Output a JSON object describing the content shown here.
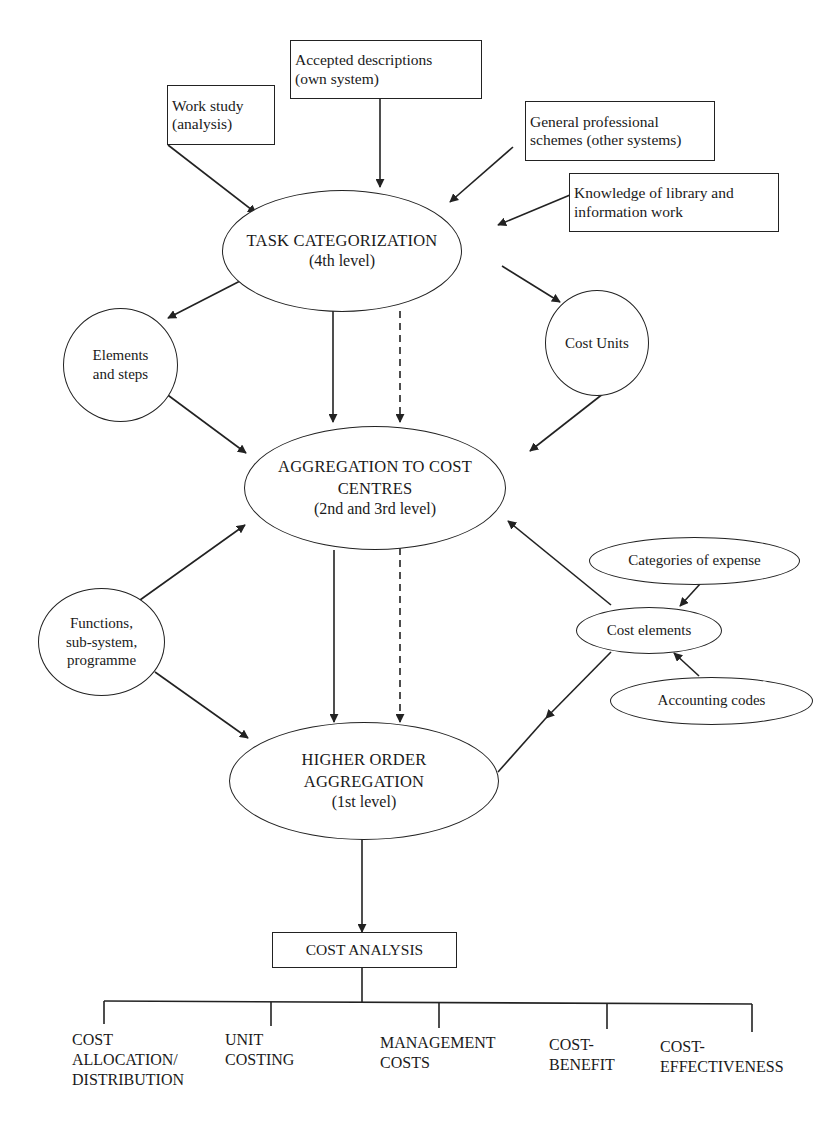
{
  "inputs": {
    "work_study": [
      "Work study",
      "(analysis)"
    ],
    "accepted_descriptions": [
      "Accepted descriptions",
      "(own system)"
    ],
    "general_schemes": [
      "General professional",
      "schemes (other systems)"
    ],
    "knowledge": [
      "Knowledge of library and",
      "information work"
    ]
  },
  "levels": {
    "task_categorization": [
      "TASK CATEGORIZATION",
      "(4th level)"
    ],
    "aggregation_cost_centres": [
      "AGGREGATION TO COST",
      "CENTRES",
      "(2nd and 3rd level)"
    ],
    "higher_order": [
      "HIGHER ORDER",
      "AGGREGATION",
      "(1st level)"
    ]
  },
  "side_nodes": {
    "elements_steps": [
      "Elements",
      "and steps"
    ],
    "cost_units": [
      "Cost Units"
    ],
    "functions": [
      "Functions,",
      "sub-system,",
      "programme"
    ],
    "cost_elements": [
      "Cost elements"
    ],
    "categories_expense": [
      "Categories of expense"
    ],
    "accounting_codes": [
      "Accounting codes"
    ]
  },
  "cost_analysis": {
    "title": "COST ANALYSIS",
    "branches": [
      {
        "lines": [
          "COST",
          "ALLOCATION/",
          "DISTRIBUTION"
        ]
      },
      {
        "lines": [
          "UNIT",
          "COSTING"
        ]
      },
      {
        "lines": [
          "MANAGEMENT",
          "COSTS"
        ]
      },
      {
        "lines": [
          "COST-",
          "BENEFIT"
        ]
      },
      {
        "lines": [
          "COST-",
          "EFFECTIVENESS"
        ]
      }
    ]
  },
  "colors": {
    "stroke": "#222222",
    "background": "#ffffff",
    "text": "#1a1a1a"
  }
}
